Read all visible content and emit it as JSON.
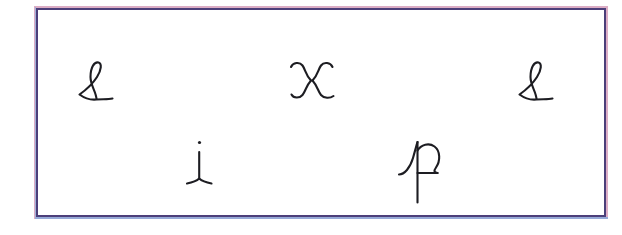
{
  "image": {
    "kind": "scanned-handwriting-sheet",
    "background_color": "#ffffff",
    "paper_color": "#ffffff"
  },
  "frame": {
    "name": "ink-rectangle",
    "stroke_color": "#4c3f7a",
    "halo_color": "#c06a96",
    "fringe_color": "#7fa8dd",
    "left": 18,
    "top": 4,
    "width": 570,
    "height": 209
  },
  "glyphs": [
    {
      "id": "glyph-ell-left",
      "character": "ℓ",
      "name": "cursive-ell",
      "row": "top",
      "x": 76,
      "y": 58,
      "width": 40,
      "height": 48,
      "color": "#1d1d22"
    },
    {
      "id": "glyph-x-center",
      "character": "x",
      "name": "cursive-ex",
      "row": "top",
      "x": 288,
      "y": 60,
      "width": 48,
      "height": 44,
      "color": "#1d1d22"
    },
    {
      "id": "glyph-ell-right",
      "character": "ℓ",
      "name": "cursive-ell",
      "row": "top",
      "x": 516,
      "y": 58,
      "width": 40,
      "height": 48,
      "color": "#1d1d22"
    },
    {
      "id": "glyph-i-bottom-left",
      "character": "i",
      "name": "cursive-eye",
      "row": "bottom",
      "x": 182,
      "y": 138,
      "width": 34,
      "height": 52,
      "color": "#1d1d22"
    },
    {
      "id": "glyph-p-bottom-right",
      "character": "p",
      "name": "cursive-pee",
      "row": "bottom",
      "x": 396,
      "y": 136,
      "width": 50,
      "height": 72,
      "color": "#1d1d22"
    }
  ],
  "text": {
    "top_row": "ℓ    x    ℓ",
    "bottom_row": "i    p",
    "all_characters": "ℓ x ℓ i p"
  }
}
